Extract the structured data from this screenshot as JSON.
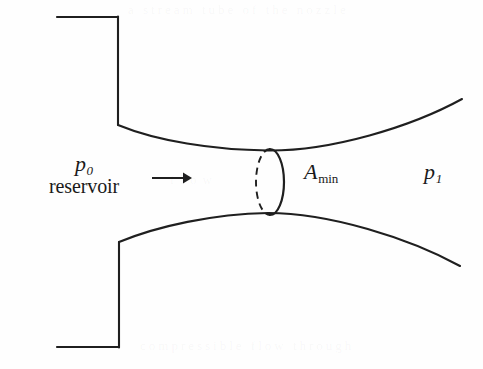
{
  "figure": {
    "background_color": "#fefefe",
    "line_color": "#1a1a1a",
    "width": 483,
    "height": 369
  },
  "labels": {
    "reservoir_pressure_symbol": "p",
    "reservoir_pressure_subscript": "0",
    "reservoir_word": "reservoir",
    "throat_area_symbol": "A",
    "throat_area_subscript": "min",
    "exit_pressure_symbol": "p",
    "exit_pressure_subscript": "1"
  },
  "ghost_text": {
    "top": "a stream tube of the nozzle",
    "middle": "flow",
    "bottom": "compressible flow through"
  },
  "geometry": {
    "upper_wall": {
      "top_horizontal": {
        "x1": 57,
        "y1": 17,
        "x2": 118,
        "y2": 17
      },
      "vertical_drop": {
        "x1": 118,
        "y1": 17,
        "x2": 118,
        "y2": 125
      },
      "curve": "M118,125 C160,140 215,150 268,150 C330,150 410,127 462,99"
    },
    "lower_wall": {
      "bottom_horizontal": {
        "x1": 57,
        "y1": 347,
        "x2": 119,
        "y2": 347
      },
      "vertical_rise": {
        "x1": 119,
        "y1": 347,
        "x2": 119,
        "y2": 242
      },
      "curve": "M119,242 C160,227 214,214 268,213 C328,213 408,237 460,266"
    },
    "throat_ellipse": {
      "center_x": 270,
      "center_y": 182,
      "radius_x": 14,
      "radius_y": 33,
      "front_half": "solid",
      "back_half": "dashed"
    },
    "flow_arrow": {
      "x1": 152,
      "y1": 178,
      "x2": 190,
      "y2": 178,
      "direction": "right"
    }
  }
}
